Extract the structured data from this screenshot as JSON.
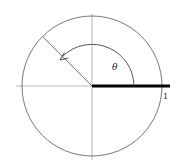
{
  "diagram": {
    "type": "unit-circle-angle",
    "labels": {
      "theta": "θ",
      "one": "1"
    },
    "geometry": {
      "center": [
        92,
        86
      ],
      "circle_radius": 70,
      "angle_deg": 135,
      "arc_radius": 42
    },
    "colors": {
      "stroke": "#555555",
      "axis": "#999999",
      "thick_bar": "#000000",
      "background": "#ffffff"
    }
  }
}
